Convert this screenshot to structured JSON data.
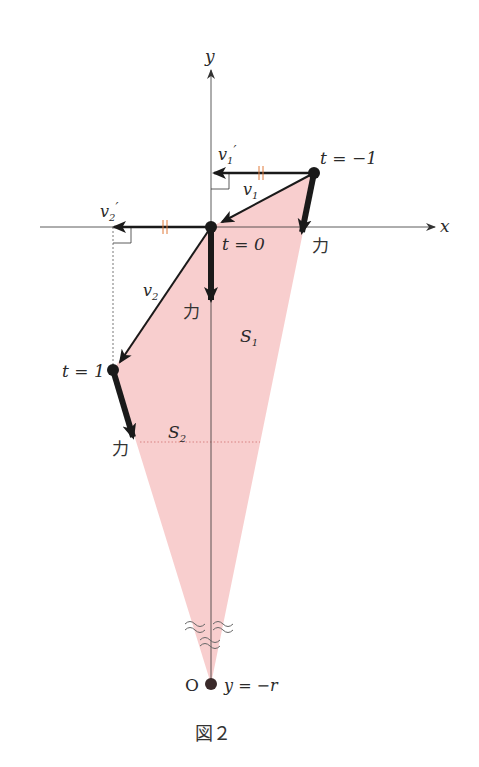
{
  "figure": {
    "caption": "図２",
    "colors": {
      "region_fill": "#f7c9c9",
      "arrow": "#1a1a1a",
      "axis": "#333333",
      "equal_mark": "#e07a3a",
      "point": "#1a1a1a",
      "origin_point": "#3a2a2a"
    }
  },
  "axes": {
    "x_label": "x",
    "y_label": "y"
  },
  "points": {
    "t_minus1": {
      "label": "t = −1"
    },
    "t_0": {
      "label": "t = 0"
    },
    "t_1": {
      "label": "t = 1"
    },
    "origin": {
      "label": "O",
      "eq_label": "y = −r"
    }
  },
  "vectors": {
    "v1": {
      "label": "v",
      "sub": "1"
    },
    "v1_prime": {
      "label": "v",
      "sub": "1",
      "prime": "′"
    },
    "v2": {
      "label": "v",
      "sub": "2"
    },
    "v2_prime": {
      "label": "v",
      "sub": "2",
      "prime": "′"
    }
  },
  "forces": {
    "force_label": "力"
  },
  "regions": {
    "S1": {
      "label": "S",
      "sub": "1"
    },
    "S2": {
      "label": "S",
      "sub": "2"
    }
  }
}
